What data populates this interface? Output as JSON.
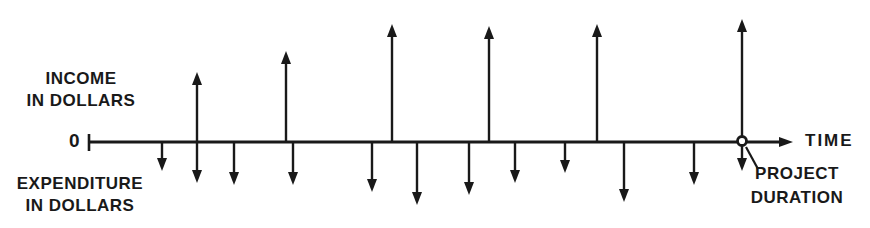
{
  "labels": {
    "income_line1": "INCOME",
    "income_line2": "IN DOLLARS",
    "origin": "0",
    "expenditure_line1": "EXPENDITURE",
    "expenditure_line2": "IN DOLLARS",
    "time": "TIME",
    "project_line1": "PROJECT",
    "project_line2": "DURATION"
  },
  "colors": {
    "ink": "#191919",
    "background": "#ffffff"
  },
  "diagram": {
    "axis": {
      "y": 142,
      "x_start": 88,
      "x_head_tip": 793,
      "origin_tick": true
    },
    "income_arrows": [
      {
        "x": 197,
        "tip_y": 72
      },
      {
        "x": 286,
        "tip_y": 51
      },
      {
        "x": 392,
        "tip_y": 24
      },
      {
        "x": 489,
        "tip_y": 26
      },
      {
        "x": 597,
        "tip_y": 24
      },
      {
        "x": 742,
        "tip_y": 19
      }
    ],
    "expenditure_arrows": [
      {
        "x": 162,
        "tip_y": 171
      },
      {
        "x": 197,
        "tip_y": 183
      },
      {
        "x": 234,
        "tip_y": 185
      },
      {
        "x": 293,
        "tip_y": 185
      },
      {
        "x": 372,
        "tip_y": 192
      },
      {
        "x": 417,
        "tip_y": 205
      },
      {
        "x": 469,
        "tip_y": 195
      },
      {
        "x": 515,
        "tip_y": 183
      },
      {
        "x": 565,
        "tip_y": 173
      },
      {
        "x": 624,
        "tip_y": 202
      },
      {
        "x": 694,
        "tip_y": 185
      },
      {
        "x": 742,
        "tip_y": 171
      }
    ],
    "project_end_marker": {
      "x": 742,
      "y": 141,
      "radius": 4.5
    },
    "callout_line": {
      "x1": 746,
      "y1": 147,
      "x2": 758,
      "y2": 169
    }
  }
}
